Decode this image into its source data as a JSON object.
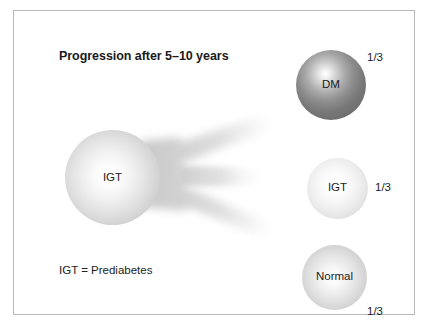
{
  "figure": {
    "title": "Progression after 5–10 years",
    "footnote": "IGT = Prediabetes",
    "source_node": {
      "label": "IGT",
      "name": "source-sphere-igt"
    },
    "outcomes": [
      {
        "label": "DM",
        "fraction": "1/3",
        "shade": "#6d6d6d"
      },
      {
        "label": "IGT",
        "fraction": "1/3",
        "shade": "#e2e2e2"
      },
      {
        "label": "Normal",
        "fraction": "1/3",
        "shade": "#d4d4d4"
      }
    ],
    "colors": {
      "border": "#b9b9b9",
      "background": "#ffffff",
      "text": "#1b1b1b",
      "flow": "#d8d8d8"
    }
  }
}
